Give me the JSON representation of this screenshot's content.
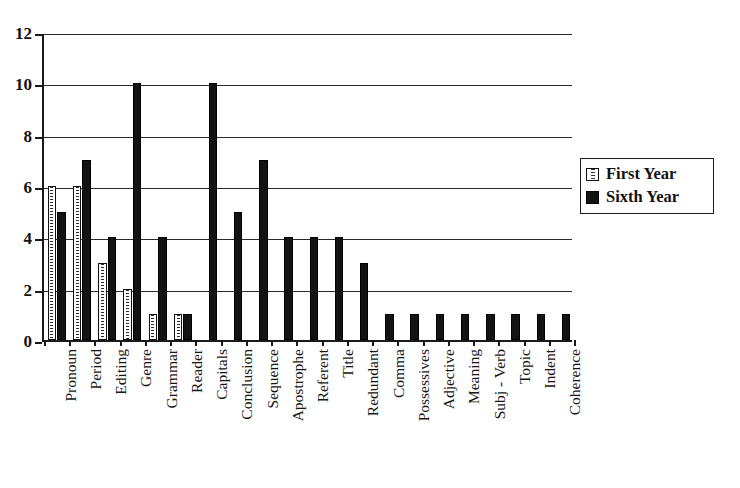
{
  "chart_data": {
    "type": "bar",
    "title": "",
    "subtitle": "",
    "xlabel": "",
    "ylabel": "",
    "ylim": [
      0,
      12
    ],
    "yticks": [
      0,
      2,
      4,
      6,
      8,
      10,
      12
    ],
    "grid": true,
    "legend_position": "right",
    "categories": [
      "Pronoun",
      "Period",
      "Editing",
      "Genre",
      "Grammar",
      "Reader",
      "Capitals",
      "Conclusion",
      "Sequence",
      "Apostrophe",
      "Referent",
      "Title",
      "Redundant",
      "Comma",
      "Possessives",
      "Adjective",
      "Meaning",
      "Subj - Verb",
      "Topic",
      "Indent",
      "Coherence"
    ],
    "series": [
      {
        "name": "First Year",
        "style": "dotted-white",
        "color": "#ffffff",
        "values": [
          6,
          6,
          3,
          2,
          1,
          1,
          0,
          0,
          0,
          0,
          0,
          0,
          0,
          0,
          0,
          0,
          0,
          0,
          0,
          0,
          0
        ]
      },
      {
        "name": "Sixth Year",
        "style": "solid-black",
        "color": "#131313",
        "values": [
          5,
          7,
          4,
          10,
          4,
          1,
          10,
          5,
          7,
          4,
          4,
          4,
          3,
          1,
          1,
          1,
          1,
          1,
          1,
          1,
          1
        ]
      }
    ]
  },
  "legend": {
    "entries": [
      {
        "label": "First Year",
        "swatch": "first-year-swatch"
      },
      {
        "label": "Sixth Year",
        "swatch": "sixth-year-swatch"
      }
    ]
  }
}
